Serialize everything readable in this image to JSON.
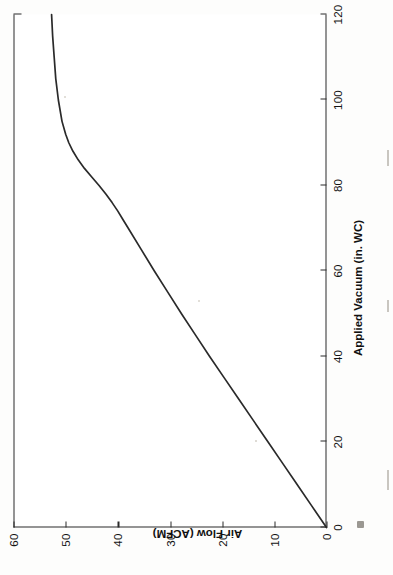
{
  "figure": {
    "title": "",
    "orientation": "rotated-90-ccw",
    "line_color": "#2a2a2a",
    "background_color": "#ffffff"
  },
  "axes": {
    "x": {
      "label": "Applied Vacuum (in. WC)",
      "ticks": [
        "0",
        "20",
        "40",
        "60",
        "80",
        "100",
        "120"
      ],
      "min": 0,
      "max": 120
    },
    "y": {
      "label": "Air Flow (ACFM)",
      "ticks": [
        "0",
        "10",
        "20",
        "30",
        "40",
        "50",
        "60"
      ],
      "min": 0,
      "max": 60
    }
  },
  "chart_data": {
    "type": "line",
    "title": "",
    "xlabel": "Applied Vacuum (in. WC)",
    "ylabel": "Air Flow (ACFM)",
    "xlim": [
      0,
      120
    ],
    "ylim": [
      0,
      60
    ],
    "xticks": [
      0,
      20,
      40,
      60,
      80,
      100,
      120
    ],
    "yticks": [
      0,
      10,
      20,
      30,
      40,
      50,
      60
    ],
    "grid": false,
    "legend": null,
    "series": [
      {
        "name": "Air Flow vs Applied Vacuum",
        "x": [
          0,
          5,
          10,
          15,
          20,
          25,
          30,
          35,
          40,
          45,
          50,
          55,
          60,
          65,
          70,
          72,
          74,
          76,
          78,
          80,
          82,
          84,
          86,
          88,
          90,
          92,
          95,
          100,
          105,
          110,
          115,
          120
        ],
        "y": [
          0,
          2.8,
          5.6,
          8.4,
          11.2,
          14.0,
          16.8,
          19.6,
          22.4,
          25.1,
          27.8,
          30.4,
          33.0,
          35.5,
          38.0,
          39.0,
          40.0,
          41.1,
          42.3,
          43.6,
          45.0,
          46.4,
          47.6,
          48.6,
          49.4,
          50.0,
          50.7,
          51.4,
          51.9,
          52.2,
          52.5,
          52.7
        ]
      }
    ]
  }
}
